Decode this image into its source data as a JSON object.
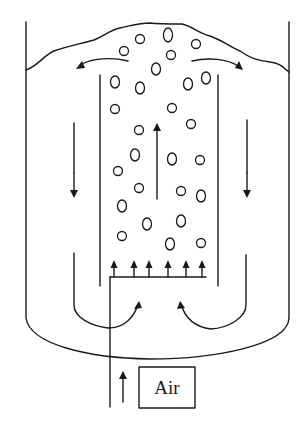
{
  "diagram": {
    "labels": {
      "air": "Air"
    },
    "components": [
      "outer-vessel",
      "liquid-surface",
      "draft-tube",
      "baffle-left",
      "baffle-right",
      "air-sparger",
      "air-inlet-pipe",
      "gas-bubbles"
    ],
    "flows": [
      {
        "name": "riser-upflow",
        "direction": "up"
      },
      {
        "name": "top-outflow-left",
        "direction": "left-down"
      },
      {
        "name": "top-outflow-right",
        "direction": "right-down"
      },
      {
        "name": "downcomer-left",
        "direction": "down"
      },
      {
        "name": "downcomer-right",
        "direction": "down"
      },
      {
        "name": "bottom-return-left",
        "direction": "up-into-riser"
      },
      {
        "name": "bottom-return-right",
        "direction": "up-into-riser"
      },
      {
        "name": "air-inlet",
        "direction": "up"
      }
    ],
    "sparger_outlets": 6,
    "colors": {
      "line": "#1a1a1a",
      "background": "#ffffff"
    }
  }
}
